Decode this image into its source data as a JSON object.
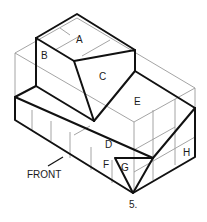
{
  "figure": {
    "number": "5.",
    "front_label": "FRONT",
    "surface_labels": [
      "A",
      "B",
      "C",
      "D",
      "E",
      "F",
      "G",
      "H"
    ]
  },
  "colors": {
    "object_lines": "#111111",
    "construction_lines": "#9a9a9a",
    "background": "#ffffff"
  }
}
